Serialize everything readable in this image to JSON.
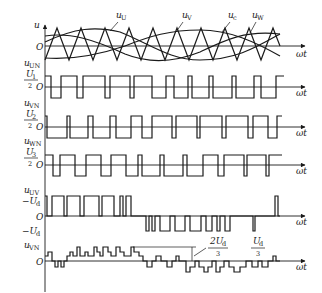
{
  "figure": {
    "type": "SPWM three-phase inverter waveforms",
    "x_axis_label": "ωt",
    "origin_label": "O",
    "panels": [
      {
        "id": "reference-carrier",
        "y_label": "u",
        "curves": [
          "u_U",
          "u_V",
          "u_W",
          "u_c"
        ],
        "labels": {
          "u_U": "u",
          "u_U_sub": "U",
          "u_V": "u",
          "u_V_sub": "V",
          "u_c": "u",
          "u_c_sub": "c",
          "u_W": "u",
          "u_W_sub": "W"
        }
      },
      {
        "id": "u-UN",
        "y_label": "u",
        "y_label_sub": "UN",
        "level_label_num": "U",
        "level_label_num_sub": "1",
        "level_label_den": "2"
      },
      {
        "id": "u-VN",
        "y_label": "u",
        "y_label_sub": "VN",
        "level_label_num": "U",
        "level_label_num_sub": "2",
        "level_label_den": "2"
      },
      {
        "id": "u-WN",
        "y_label": "u",
        "y_label_sub": "WN",
        "level_label_num": "U",
        "level_label_num_sub": "3",
        "level_label_den": "2"
      },
      {
        "id": "u-UV",
        "y_label": "u",
        "y_label_sub": "UV",
        "top_level": "−U",
        "top_level_sub": "d",
        "bottom_level": "−U",
        "bottom_level_sub": "d"
      },
      {
        "id": "u-VN-phase",
        "y_label": "u",
        "y_label_sub": "VN",
        "annotations": {
          "two_thirds_num": "2U",
          "two_thirds_num_sub": "d",
          "two_thirds_den": "3",
          "one_third_num": "U",
          "one_third_num_sub": "d",
          "one_third_den": "3"
        }
      }
    ]
  }
}
